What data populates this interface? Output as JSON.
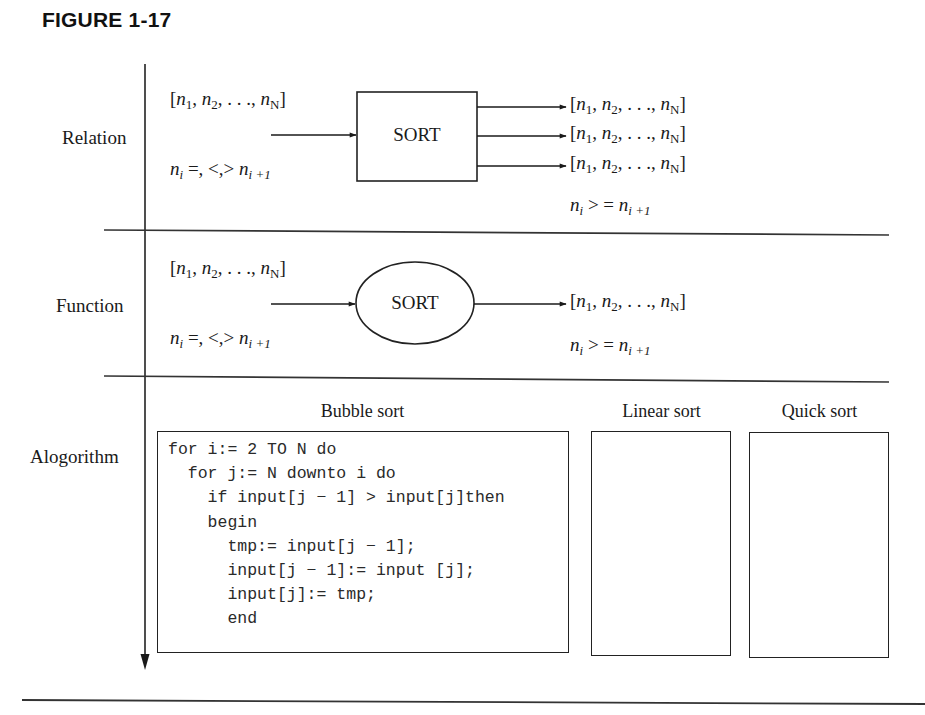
{
  "figure": {
    "title": "FIGURE 1-17"
  },
  "rows": {
    "relation": {
      "label": "Relation",
      "input_list": {
        "open": "[",
        "items": [
          "n",
          "n",
          ". . .,",
          "n"
        ],
        "subs": [
          "1",
          "2",
          "",
          "N"
        ],
        "close": "]"
      },
      "input_condition": {
        "lhs": "n",
        "lhs_sub": "i",
        "op": " =, <,> ",
        "rhs": "n",
        "rhs_sub": "i +1"
      },
      "process_label": "SORT",
      "process_shape": "rectangle",
      "outputs_count": 3,
      "output_condition": {
        "lhs": "n",
        "lhs_sub": "i",
        "op": " > = ",
        "rhs": "n",
        "rhs_sub": "i +1"
      }
    },
    "function": {
      "label": "Function",
      "input_condition": {
        "lhs": "n",
        "lhs_sub": "i",
        "op": " =, <,> ",
        "rhs": "n",
        "rhs_sub": "i +1"
      },
      "process_label": "SORT",
      "process_shape": "ellipse",
      "outputs_count": 1,
      "output_condition": {
        "lhs": "n",
        "lhs_sub": "i",
        "op": " > = ",
        "rhs": "n",
        "rhs_sub": "i +1"
      }
    },
    "algorithm": {
      "label": "Alogorithm",
      "columns": [
        {
          "title": "Bubble sort",
          "code": "for i:= 2 TO N do\n  for j:= N downto i do\n    if input[j − 1] > input[j]then\n    begin\n      tmp:= input[j − 1];\n      input[j − 1]:= input [j];\n      input[j]:= tmp;\n      end"
        },
        {
          "title": "Linear sort",
          "code": ""
        },
        {
          "title": "Quick sort",
          "code": ""
        }
      ]
    }
  },
  "list_text": {
    "open": "[",
    "n": "n",
    "sub1": "1",
    "sep": ", ",
    "sub2": "2",
    "ellipsis": ", . . ., ",
    "subN": "N",
    "close": "]"
  },
  "colors": {
    "ink": "#1a1a1a",
    "background": "#ffffff"
  }
}
